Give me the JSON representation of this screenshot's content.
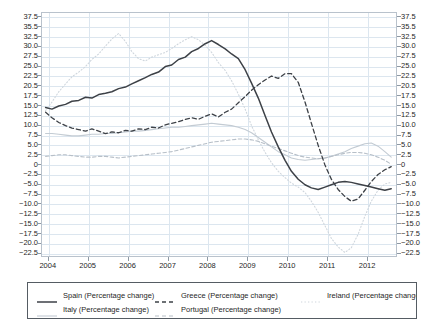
{
  "chart": {
    "title": "",
    "subtitle": "",
    "xlabel": "",
    "ylabel": ""
  },
  "axes": {
    "y_ticks": [
      "37.5",
      "35.5",
      "32.5",
      "30.0",
      "27.5",
      "25.0",
      "22.5",
      "20.5",
      "17.5",
      "15.0",
      "12.5",
      "10.0",
      "7.5",
      "5.0",
      "2.5",
      "0",
      "−2.5",
      "−5.0",
      "−7.5",
      "−10.0",
      "−12.5",
      "−15.0",
      "−17.5",
      "−20.0",
      "−22.5"
    ],
    "y_values": [
      37.5,
      35.0,
      32.5,
      30.0,
      27.5,
      25.0,
      22.5,
      20.0,
      17.5,
      15.0,
      12.5,
      10.0,
      7.5,
      5.0,
      2.5,
      0,
      -2.5,
      -5.0,
      -7.5,
      -10.0,
      -12.5,
      -15.0,
      -17.5,
      -20.0,
      -22.5
    ],
    "x_ticks": [
      "2004",
      "2005",
      "2006",
      "2007",
      "2008",
      "2009",
      "2010",
      "2011",
      "2012"
    ],
    "x_values": [
      2004,
      2005,
      2006,
      2007,
      2008,
      2009,
      2010,
      2011,
      2012
    ]
  },
  "legend": {
    "position": "bottom",
    "entries": [
      {
        "label": "Spain (Percentage change)",
        "style": "solid",
        "color": "#3d4147",
        "width": 1.5,
        "row": 0,
        "col": 0
      },
      {
        "label": "Greece (Percentage change)",
        "style": "dashed",
        "color": "#3d4147",
        "width": 1.3,
        "row": 0,
        "col": 1
      },
      {
        "label": "Ireland (Percentage change)",
        "style": "dotted",
        "color": "#cfd6dd",
        "width": 1.1,
        "row": 0,
        "col": 2
      },
      {
        "label": "Italy (Percentage change)",
        "style": "solid",
        "color": "#c3cbd3",
        "width": 1.1,
        "row": 1,
        "col": 0
      },
      {
        "label": "Portugal (Percentage change)",
        "style": "dashed",
        "color": "#b7bfc8",
        "width": 1.1,
        "row": 1,
        "col": 1
      }
    ]
  },
  "chart_data": {
    "type": "line",
    "title": "",
    "xlabel": "",
    "ylabel": "",
    "xlim": [
      2003.83,
      2012.75
    ],
    "ylim": [
      -23.6,
      38.6
    ],
    "grid": true,
    "legend_position": "bottom",
    "x": [
      2003.92,
      2004.08,
      2004.25,
      2004.42,
      2004.58,
      2004.75,
      2004.92,
      2005.08,
      2005.25,
      2005.42,
      2005.58,
      2005.75,
      2005.92,
      2006.08,
      2006.25,
      2006.42,
      2006.58,
      2006.75,
      2006.92,
      2007.08,
      2007.25,
      2007.42,
      2007.58,
      2007.75,
      2007.92,
      2008.08,
      2008.25,
      2008.42,
      2008.58,
      2008.75,
      2008.92,
      2009.08,
      2009.25,
      2009.42,
      2009.58,
      2009.75,
      2009.92,
      2010.08,
      2010.25,
      2010.42,
      2010.58,
      2010.75,
      2010.92,
      2011.08,
      2011.25,
      2011.42,
      2011.58,
      2011.75,
      2011.92,
      2012.08,
      2012.25,
      2012.42,
      2012.58
    ],
    "series": [
      {
        "name": "Spain (Percentage change)",
        "style": "solid",
        "color": "#3d4147",
        "values": [
          14.6,
          14.2,
          15.0,
          15.4,
          16.2,
          16.4,
          17.2,
          17.0,
          17.9,
          18.2,
          18.6,
          19.4,
          19.8,
          20.6,
          21.4,
          22.2,
          23.0,
          23.6,
          25.0,
          25.4,
          26.8,
          27.4,
          28.8,
          29.6,
          30.8,
          31.6,
          30.6,
          29.5,
          28.2,
          27.0,
          24.2,
          20.8,
          17.0,
          12.5,
          8.4,
          4.6,
          1.2,
          -1.6,
          -3.6,
          -5.0,
          -5.8,
          -6.2,
          -5.6,
          -5.0,
          -4.4,
          -4.2,
          -4.4,
          -4.8,
          -5.2,
          -5.6,
          -6.0,
          -6.4,
          -6.0
        ]
      },
      {
        "name": "Greece (Percentage change)",
        "style": "dashed",
        "color": "#3d4147",
        "values": [
          13.4,
          12.0,
          10.8,
          10.0,
          9.4,
          9.0,
          8.6,
          9.2,
          8.6,
          8.0,
          8.4,
          8.2,
          8.8,
          8.6,
          9.2,
          9.0,
          9.6,
          9.4,
          10.2,
          10.6,
          11.0,
          11.6,
          12.0,
          11.6,
          12.4,
          13.0,
          12.2,
          13.4,
          14.2,
          15.8,
          17.4,
          19.0,
          20.4,
          21.6,
          22.6,
          22.0,
          23.2,
          23.2,
          21.0,
          16.0,
          10.6,
          5.0,
          0.0,
          -3.6,
          -6.2,
          -8.0,
          -9.2,
          -8.6,
          -6.4,
          -4.2,
          -2.4,
          -1.2,
          -0.4
        ]
      },
      {
        "name": "Ireland (Percentage change)",
        "style": "dotted",
        "color": "#cfd6dd",
        "values": [
          13.8,
          16.0,
          18.6,
          20.6,
          22.4,
          23.6,
          25.0,
          26.8,
          28.2,
          30.2,
          32.0,
          33.4,
          31.4,
          28.8,
          27.0,
          26.4,
          27.4,
          28.0,
          28.6,
          29.6,
          30.8,
          31.8,
          32.6,
          31.8,
          30.4,
          28.6,
          26.0,
          24.0,
          21.4,
          18.0,
          14.2,
          10.0,
          6.4,
          3.2,
          0.6,
          -1.6,
          -3.2,
          -4.6,
          -5.6,
          -7.0,
          -9.2,
          -12.0,
          -15.4,
          -18.6,
          -20.8,
          -22.2,
          -21.0,
          -17.6,
          -13.0,
          -9.2,
          -6.4,
          -4.8,
          -4.4
        ]
      },
      {
        "name": "Italy (Percentage change)",
        "style": "solid",
        "color": "#c3cbd3",
        "values": [
          8.0,
          8.0,
          7.8,
          7.6,
          7.4,
          7.4,
          7.6,
          7.8,
          7.8,
          8.0,
          8.0,
          8.2,
          8.4,
          8.6,
          8.6,
          8.8,
          9.0,
          9.2,
          9.4,
          9.6,
          9.6,
          9.8,
          10.0,
          10.2,
          10.4,
          10.6,
          10.4,
          10.2,
          10.0,
          9.6,
          9.0,
          8.2,
          7.0,
          5.8,
          4.6,
          3.4,
          2.6,
          1.8,
          1.4,
          1.2,
          1.4,
          1.6,
          1.8,
          2.2,
          2.8,
          3.4,
          4.2,
          4.8,
          5.4,
          5.6,
          4.8,
          3.4,
          2.0
        ]
      },
      {
        "name": "Portugal (Percentage change)",
        "style": "dashed",
        "color": "#b7bfc8",
        "values": [
          2.2,
          2.4,
          2.6,
          2.6,
          2.4,
          2.2,
          2.0,
          2.0,
          2.2,
          2.2,
          2.0,
          1.8,
          2.0,
          2.2,
          2.4,
          2.6,
          2.8,
          3.0,
          3.2,
          3.4,
          3.8,
          4.2,
          4.6,
          5.0,
          5.4,
          5.8,
          6.0,
          6.2,
          6.4,
          6.6,
          6.6,
          6.4,
          6.0,
          5.4,
          4.8,
          4.2,
          3.6,
          3.0,
          2.4,
          2.0,
          1.8,
          1.6,
          1.8,
          2.2,
          2.6,
          3.0,
          3.2,
          3.2,
          3.0,
          2.6,
          2.0,
          1.2,
          0.2
        ]
      }
    ]
  }
}
